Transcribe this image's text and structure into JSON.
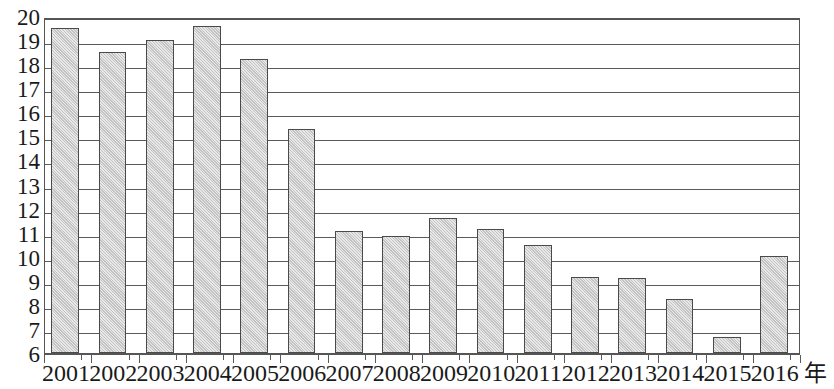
{
  "chart_data": {
    "type": "bar",
    "title": "",
    "subtitle": "",
    "xlabel": "年",
    "ylabel": "",
    "categories": [
      "2001",
      "2002",
      "2003",
      "2004",
      "2005",
      "2006",
      "2007",
      "2008",
      "2009",
      "2010",
      "2011",
      "2012",
      "2013",
      "2014",
      "2015",
      "2016"
    ],
    "values": [
      19.5,
      18.5,
      19.0,
      19.6,
      18.2,
      15.3,
      11.05,
      10.85,
      11.6,
      11.15,
      10.5,
      9.15,
      9.1,
      8.25,
      6.65,
      10.05
    ],
    "series": [
      {
        "name": "",
        "values": [
          19.5,
          18.5,
          19.0,
          19.6,
          18.2,
          15.3,
          11.05,
          10.85,
          11.6,
          11.15,
          10.5,
          9.15,
          9.1,
          8.25,
          6.65,
          10.05
        ]
      }
    ],
    "ylim": [
      6,
      20
    ],
    "y_ticks": [
      20,
      19,
      18,
      17,
      16,
      15,
      14,
      13,
      12,
      11,
      10,
      9,
      8,
      7,
      6
    ],
    "y_tick_labels": [
      "20",
      "19",
      "18",
      "17",
      "16",
      "15",
      "14",
      "13",
      "12",
      "11",
      "10",
      "9",
      "8",
      "7",
      "6"
    ],
    "grid": true,
    "grid_axis": "y",
    "legend": null,
    "legend_position": "none",
    "annotations": [],
    "colors": {
      "bar_fill": "#cdcdcd",
      "bar_border": "#4a4a4a",
      "gridline": "#5a5a5a",
      "axis": "#555555",
      "text": "#1a1a1a",
      "background": "#ffffff"
    }
  }
}
